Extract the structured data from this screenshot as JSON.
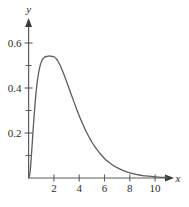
{
  "chart_data": {
    "type": "line",
    "title": "",
    "subtitle": "",
    "xlabel": "x",
    "ylabel": "y",
    "xlim": [
      0,
      11.5
    ],
    "ylim": [
      0,
      0.66
    ],
    "grid": false,
    "legend": "none",
    "x_ticks_major": [
      2,
      4,
      6,
      8,
      10
    ],
    "x_tick_labels": [
      "2",
      "4",
      "6",
      "8",
      "10"
    ],
    "y_ticks_major": [
      0.2,
      0.4,
      0.6
    ],
    "y_tick_labels": [
      "0.2",
      "0.4",
      "0.6"
    ],
    "y_ticks_minor": [
      0.1,
      0.3,
      0.5
    ],
    "annotations": [],
    "series": [
      {
        "name": "density",
        "color": "#5c5c5c",
        "peak_x": 2.0,
        "peak_y": 0.54,
        "x": [
          0.0,
          0.1,
          0.2,
          0.3,
          0.4,
          0.5,
          0.6,
          0.7,
          0.8,
          0.9,
          1.0,
          1.1,
          1.2,
          1.3,
          1.4,
          1.5,
          1.6,
          1.7,
          1.8,
          1.9,
          2.0,
          2.1,
          2.2,
          2.3,
          2.4,
          2.5,
          2.6,
          2.7,
          2.8,
          2.9,
          3.0,
          3.2,
          3.4,
          3.6,
          3.8,
          4.0,
          4.2,
          4.4,
          4.6,
          4.8,
          5.0,
          5.25,
          5.5,
          5.75,
          6.0,
          6.25,
          6.5,
          6.75,
          7.0,
          7.5,
          8.0,
          8.5,
          9.0,
          9.5,
          10.0,
          10.5,
          11.0
        ],
        "y": [
          0.0,
          0.018,
          0.082,
          0.166,
          0.249,
          0.324,
          0.386,
          0.434,
          0.47,
          0.497,
          0.515,
          0.527,
          0.534,
          0.538,
          0.54,
          0.541,
          0.542,
          0.542,
          0.541,
          0.54,
          0.539,
          0.535,
          0.529,
          0.521,
          0.511,
          0.5,
          0.487,
          0.473,
          0.459,
          0.444,
          0.429,
          0.398,
          0.367,
          0.336,
          0.306,
          0.277,
          0.25,
          0.225,
          0.201,
          0.18,
          0.16,
          0.138,
          0.119,
          0.102,
          0.087,
          0.074,
          0.063,
          0.054,
          0.046,
          0.033,
          0.023,
          0.016,
          0.011,
          0.008,
          0.005,
          0.003,
          0.002
        ]
      }
    ],
    "axis_arrows": {
      "x": true,
      "y": true
    },
    "axis_color": "#5c5c5c",
    "origin_label": ""
  },
  "axes": {
    "y_axis_label": "y",
    "x_axis_label": "x"
  }
}
